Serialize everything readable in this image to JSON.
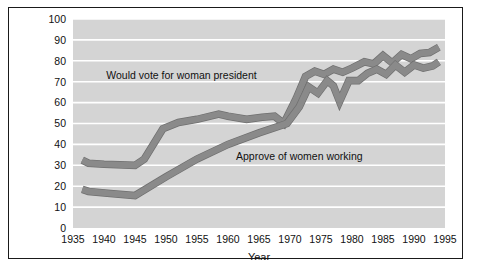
{
  "chart_data": {
    "type": "line",
    "title": "",
    "xlabel": "Year",
    "ylabel": "",
    "xlim": [
      1935,
      1995
    ],
    "ylim": [
      0,
      100
    ],
    "grid": "horizontal",
    "legend_position": "inline-annotations",
    "plot_background": "#d4d4d4",
    "gridline_color": "#ffffff",
    "line_color": "#8a8a8a",
    "line_edge_color": "#6f6f6f",
    "x_ticks": [
      1935,
      1940,
      1945,
      1950,
      1955,
      1960,
      1965,
      1970,
      1975,
      1980,
      1985,
      1990,
      1995
    ],
    "x_tick_labels": [
      "1935",
      "1940",
      "1945",
      "1950",
      "1955",
      "1960",
      "1965",
      "1970",
      "1975",
      "1980",
      "1985",
      "1990",
      "1995"
    ],
    "y_ticks": [
      0,
      10,
      20,
      30,
      40,
      50,
      60,
      70,
      80,
      90,
      100
    ],
    "y_tick_labels": [
      "0",
      "10",
      "20",
      "30",
      "40",
      "50",
      "60",
      "70",
      "80",
      "90",
      "100"
    ],
    "series": [
      {
        "name": "Would vote for woman president",
        "label_x": 1952.5,
        "label_y": 73,
        "points": [
          [
            1936.5,
            32.5
          ],
          [
            1937.5,
            31.0
          ],
          [
            1940.0,
            30.5
          ],
          [
            1945.0,
            30.0
          ],
          [
            1946.5,
            33.0
          ],
          [
            1949.5,
            47.5
          ],
          [
            1952.0,
            50.5
          ],
          [
            1955.0,
            52.0
          ],
          [
            1958.5,
            54.5
          ],
          [
            1960.0,
            53.5
          ],
          [
            1963.0,
            52.0
          ],
          [
            1965.5,
            53.0
          ],
          [
            1967.5,
            53.5
          ],
          [
            1969.0,
            50.0
          ],
          [
            1971.0,
            62.0
          ],
          [
            1972.5,
            72.5
          ],
          [
            1974.0,
            75.0
          ],
          [
            1975.5,
            73.5
          ],
          [
            1977.0,
            76.0
          ],
          [
            1978.5,
            74.5
          ],
          [
            1980.0,
            76.5
          ],
          [
            1982.0,
            79.5
          ],
          [
            1983.5,
            78.5
          ],
          [
            1985.0,
            82.5
          ],
          [
            1986.5,
            79.0
          ],
          [
            1988.0,
            83.0
          ],
          [
            1989.5,
            81.0
          ],
          [
            1991.0,
            83.5
          ],
          [
            1992.5,
            84.0
          ],
          [
            1994.0,
            86.5
          ]
        ]
      },
      {
        "name": "Approve of women working",
        "label_x": 1971.5,
        "label_y": 34,
        "points": [
          [
            1936.5,
            18.5
          ],
          [
            1937.5,
            17.5
          ],
          [
            1941.0,
            16.5
          ],
          [
            1945.0,
            15.5
          ],
          [
            1950.0,
            24.5
          ],
          [
            1955.0,
            33.0
          ],
          [
            1960.0,
            40.0
          ],
          [
            1965.0,
            45.5
          ],
          [
            1969.5,
            50.0
          ],
          [
            1971.5,
            58.0
          ],
          [
            1973.0,
            67.5
          ],
          [
            1974.5,
            64.5
          ],
          [
            1976.0,
            70.5
          ],
          [
            1977.0,
            68.0
          ],
          [
            1978.0,
            60.5
          ],
          [
            1979.5,
            70.5
          ],
          [
            1981.0,
            70.5
          ],
          [
            1982.5,
            74.0
          ],
          [
            1984.0,
            76.0
          ],
          [
            1985.5,
            73.5
          ],
          [
            1987.0,
            78.0
          ],
          [
            1988.5,
            74.5
          ],
          [
            1990.0,
            78.0
          ],
          [
            1991.5,
            76.5
          ],
          [
            1993.0,
            77.5
          ],
          [
            1994.0,
            79.5
          ]
        ]
      }
    ]
  }
}
